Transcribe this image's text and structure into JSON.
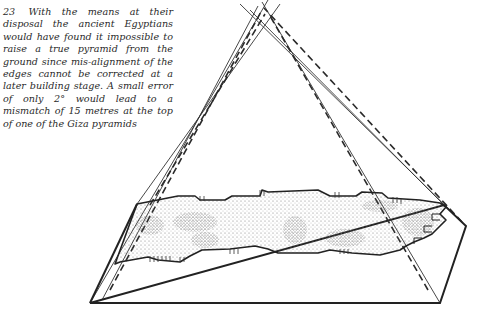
{
  "figure": {
    "number": "23",
    "caption": "With the means at their disposal the ancient Egyptians would have found it impossible to raise a true pyramid from the ground since mis-alignment of the edges cannot be corrected at a later building stage. A small error of only 2° would lead to a mismatch of 15 metres at the top of one of the Giza pyramids"
  },
  "drawing": {
    "subject": "pyramid-base-misalignment-diagram",
    "colors": {
      "ink": "#2a2a2a",
      "stipple": "#555555",
      "background": "#ffffff"
    },
    "base_outline": [
      [
        90,
        303
      ],
      [
        440,
        303
      ],
      [
        466,
        226
      ],
      [
        444,
        205
      ],
      [
        137,
        204
      ]
    ],
    "solid_edges": [
      [
        [
          137,
          204
        ],
        [
          258,
          6
        ]
      ],
      [
        [
          90,
          303
        ],
        [
          268,
          0
        ]
      ],
      [
        [
          444,
          205
        ],
        [
          245,
          2
        ]
      ],
      [
        [
          440,
          303
        ],
        [
          272,
          10
        ]
      ]
    ],
    "dashed_edges": [
      [
        [
          132,
          212
        ],
        [
          262,
          8
        ]
      ],
      [
        [
          150,
          205
        ],
        [
          268,
          12
        ]
      ],
      [
        [
          460,
          226
        ],
        [
          266,
          4
        ]
      ],
      [
        [
          420,
          300
        ],
        [
          258,
          14
        ]
      ]
    ]
  }
}
